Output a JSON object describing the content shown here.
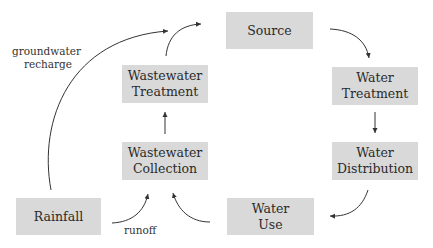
{
  "nodes": {
    "source": {
      "line1": "Source"
    },
    "water_treatment": {
      "line1": "Water",
      "line2": "Treatment"
    },
    "water_distribution": {
      "line1": "Water",
      "line2": "Distribution"
    },
    "water_use": {
      "line1": "Water",
      "line2": "Use"
    },
    "wastewater_collection": {
      "line1": "Wastewater",
      "line2": "Collection"
    },
    "wastewater_treatment": {
      "line1": "Wastewater",
      "line2": "Treatment"
    },
    "rainfall": {
      "line1": "Rainfall"
    }
  },
  "edge_labels": {
    "groundwater_recharge": {
      "line1": "groundwater",
      "line2": "recharge"
    },
    "runoff": "runoff"
  },
  "colors": {
    "box_fill": "#d9d9d9",
    "arrow": "#333333",
    "text": "#2a2a2a"
  }
}
